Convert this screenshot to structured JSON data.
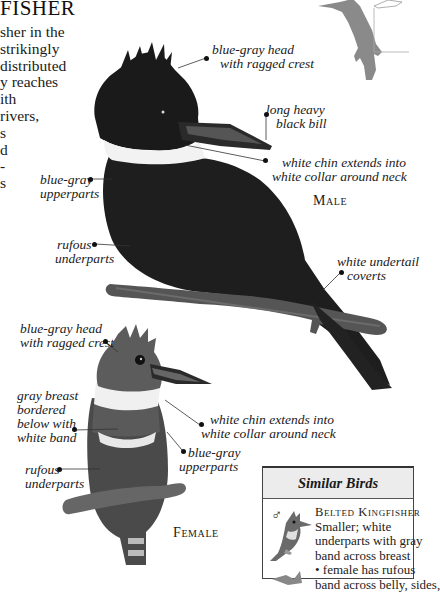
{
  "page": {
    "title": "FISHER",
    "intro_lines": [
      "sher in the",
      "strikingly",
      "distributed",
      "y reaches",
      "ith",
      " rivers,",
      "s",
      "d",
      "-",
      "s"
    ]
  },
  "male": {
    "caption": "Male",
    "labels": {
      "head": [
        "blue-gray head",
        "with ragged crest"
      ],
      "bill": [
        "long heavy",
        "black bill"
      ],
      "chin": [
        "white chin extends into",
        "white collar around neck"
      ],
      "upperparts": [
        "blue-gray",
        "upperparts"
      ],
      "underparts": [
        "rufous",
        "underparts"
      ],
      "undertail": [
        "white undertail",
        "coverts"
      ]
    }
  },
  "female": {
    "caption": "Female",
    "labels": {
      "head": [
        "blue-gray head",
        "with ragged crest"
      ],
      "breast": [
        "gray breast",
        "bordered",
        "below with",
        "white band"
      ],
      "chin": [
        "white chin extends into",
        "white collar around neck"
      ],
      "upperparts": [
        "blue-gray",
        "upperparts"
      ],
      "underparts": [
        "rufous",
        "underparts"
      ]
    }
  },
  "similar_birds": {
    "heading": "Similar Birds",
    "entries": [
      {
        "sex_symbol": "♂",
        "name": "Belted Kingfisher",
        "description_lines": [
          "Smaller; white",
          "underparts with gray",
          "band across breast",
          "• female has rufous",
          "band across belly, sides,"
        ]
      }
    ]
  },
  "colors": {
    "ink": "#1a1a1a",
    "bird_dark": "#1c1c1c",
    "silhouette": "#8a8a8a",
    "box_header_bg": "#ececec"
  }
}
